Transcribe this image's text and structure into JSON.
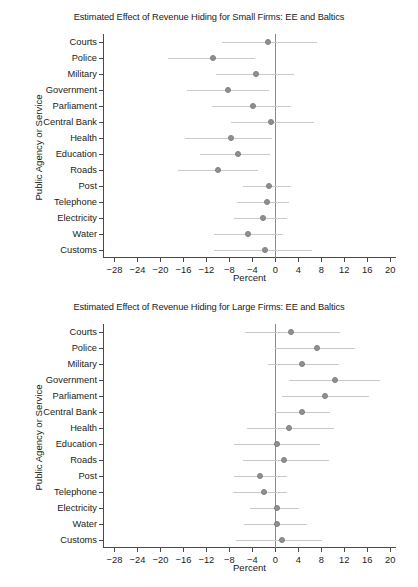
{
  "figure": {
    "axis_title_y": "Public Agency or Service",
    "axis_title_x": "Percent"
  },
  "chart_data": [
    {
      "type": "scatter",
      "title": "Estimated Effect of Revenue Hiding for Small Firms: EE and Baltics",
      "xlabel": "Percent",
      "ylabel": "Public Agency or Service",
      "xlim": [
        -30,
        21
      ],
      "xticks": [
        -28,
        -24,
        -20,
        -16,
        -12,
        -8,
        -4,
        0,
        4,
        8,
        12,
        16,
        20
      ],
      "xticklabels": [
        "-28",
        "-24",
        "-20",
        "-16",
        "-12",
        "-8",
        "-4",
        "0",
        "4",
        "8",
        "12",
        "16",
        "20"
      ],
      "grid": false,
      "legend": "none",
      "zero_reference_line": 0,
      "categories": [
        "Courts",
        "Police",
        "Military",
        "Government",
        "Parliament",
        "Central Bank",
        "Health",
        "Education",
        "Roads",
        "Post",
        "Telephone",
        "Electricity",
        "Water",
        "Customs"
      ],
      "values": [
        -1.3,
        -10.8,
        -3.4,
        -8.2,
        -3.9,
        -0.8,
        -7.7,
        -6.5,
        -10.0,
        -1.1,
        -1.4,
        -2.2,
        -4.7,
        -1.8
      ],
      "ci_low": [
        -9.2,
        -18.6,
        -10.4,
        -15.4,
        -11.0,
        -7.7,
        -15.7,
        -13.2,
        -17.0,
        -5.6,
        -6.6,
        -7.2,
        -10.6,
        -10.7
      ],
      "ci_high": [
        7.2,
        -3.5,
        3.3,
        -1.1,
        2.8,
        6.8,
        -0.5,
        -1.0,
        -3.0,
        2.8,
        2.4,
        2.1,
        1.4,
        6.3
      ]
    },
    {
      "type": "scatter",
      "title": "Estimated Effect of Revenue Hiding for Large Firms: EE and Baltics",
      "xlabel": "Percent",
      "ylabel": "Public Agency or Service",
      "xlim": [
        -30,
        21
      ],
      "xticks": [
        -28,
        -24,
        -20,
        -16,
        -12,
        -8,
        -4,
        0,
        4,
        8,
        12,
        16,
        20
      ],
      "xticklabels": [
        "-28",
        "-24",
        "-20",
        "-16",
        "-12",
        "-8",
        "-4",
        "0",
        "4",
        "8",
        "12",
        "16",
        "20"
      ],
      "grid": false,
      "legend": "none",
      "zero_reference_line": 0,
      "categories": [
        "Courts",
        "Police",
        "Military",
        "Government",
        "Parliament",
        "Central Bank",
        "Health",
        "Education",
        "Roads",
        "Post",
        "Telephone",
        "Electricity",
        "Water",
        "Customs"
      ],
      "values": [
        2.8,
        7.2,
        4.7,
        10.3,
        8.7,
        4.7,
        2.3,
        0.2,
        1.5,
        -2.6,
        -2.0,
        0.2,
        0.2,
        1.2
      ],
      "ci_low": [
        -5.2,
        0.0,
        -1.3,
        2.4,
        1.1,
        0.0,
        -5.0,
        -7.2,
        -5.6,
        -7.2,
        -7.3,
        -4.4,
        -5.4,
        -6.9
      ],
      "ci_high": [
        11.3,
        13.9,
        11.0,
        18.2,
        16.3,
        9.6,
        10.2,
        7.8,
        9.4,
        2.0,
        2.0,
        4.2,
        5.5,
        8.2
      ]
    }
  ]
}
